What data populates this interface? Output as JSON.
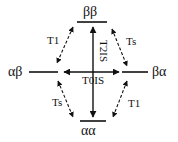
{
  "diagram": {
    "type": "energy-level-relaxation-diagram",
    "states": {
      "top": "ββ",
      "left": "αβ",
      "right": "βα",
      "bottom": "αα"
    },
    "transitions": {
      "top_left": "T1",
      "top_right": "Ts",
      "bottom_left": "Ts",
      "bottom_right": "T1",
      "vertical": "T2IS",
      "horizontal": "T0IS"
    },
    "colors": {
      "line": "#111111",
      "background": "#ffffff"
    }
  }
}
